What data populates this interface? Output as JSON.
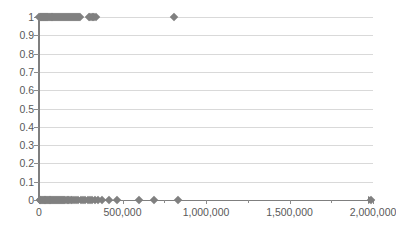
{
  "chart_data": {
    "type": "scatter",
    "title": "",
    "xlabel": "",
    "ylabel": "",
    "xlim": [
      0,
      2000000
    ],
    "ylim": [
      0,
      1
    ],
    "grid": true,
    "legend": false,
    "marker": {
      "shape": "diamond",
      "color": "#808080",
      "size": 6
    },
    "axis_color": "#7f7f7f",
    "gridline_color": "#d9d9d9",
    "label_color": "#595959",
    "y_ticks": [
      {
        "value": 1,
        "label": "1"
      },
      {
        "value": 0.9,
        "label": "0.9"
      },
      {
        "value": 0.8,
        "label": "0.8"
      },
      {
        "value": 0.7,
        "label": "0.7"
      },
      {
        "value": 0.6,
        "label": "0.6"
      },
      {
        "value": 0.5,
        "label": "0.5"
      },
      {
        "value": 0.4,
        "label": "0.4"
      },
      {
        "value": 0.3,
        "label": "0.3"
      },
      {
        "value": 0.2,
        "label": "0.2"
      },
      {
        "value": 0.1,
        "label": "0.1"
      },
      {
        "value": 0,
        "label": "0"
      }
    ],
    "x_ticks": [
      {
        "value": 0,
        "label": "0",
        "minor": false
      },
      {
        "value": 250000,
        "label": "",
        "minor": true
      },
      {
        "value": 500000,
        "label": "500,000",
        "minor": false
      },
      {
        "value": 750000,
        "label": "",
        "minor": true
      },
      {
        "value": 1000000,
        "label": "1,000,000",
        "minor": false
      },
      {
        "value": 1250000,
        "label": "",
        "minor": true
      },
      {
        "value": 1500000,
        "label": "1,500,000",
        "minor": false
      },
      {
        "value": 1750000,
        "label": "",
        "minor": true
      },
      {
        "value": 2000000,
        "label": "2,000,000",
        "minor": false
      }
    ],
    "points": [
      {
        "x": 2000,
        "y": 1
      },
      {
        "x": 6000,
        "y": 1
      },
      {
        "x": 10000,
        "y": 1
      },
      {
        "x": 14000,
        "y": 1
      },
      {
        "x": 18000,
        "y": 1
      },
      {
        "x": 22000,
        "y": 1
      },
      {
        "x": 26000,
        "y": 1
      },
      {
        "x": 30000,
        "y": 1
      },
      {
        "x": 34000,
        "y": 1
      },
      {
        "x": 38000,
        "y": 1
      },
      {
        "x": 42000,
        "y": 1
      },
      {
        "x": 46000,
        "y": 1
      },
      {
        "x": 50000,
        "y": 1
      },
      {
        "x": 55000,
        "y": 1
      },
      {
        "x": 60000,
        "y": 1
      },
      {
        "x": 65000,
        "y": 1
      },
      {
        "x": 70000,
        "y": 1
      },
      {
        "x": 75000,
        "y": 1
      },
      {
        "x": 80000,
        "y": 1
      },
      {
        "x": 85000,
        "y": 1
      },
      {
        "x": 90000,
        "y": 1
      },
      {
        "x": 95000,
        "y": 1
      },
      {
        "x": 100000,
        "y": 1
      },
      {
        "x": 106000,
        "y": 1
      },
      {
        "x": 112000,
        "y": 1
      },
      {
        "x": 118000,
        "y": 1
      },
      {
        "x": 124000,
        "y": 1
      },
      {
        "x": 130000,
        "y": 1
      },
      {
        "x": 136000,
        "y": 1
      },
      {
        "x": 142000,
        "y": 1
      },
      {
        "x": 148000,
        "y": 1
      },
      {
        "x": 154000,
        "y": 1
      },
      {
        "x": 160000,
        "y": 1
      },
      {
        "x": 166000,
        "y": 1
      },
      {
        "x": 172000,
        "y": 1
      },
      {
        "x": 178000,
        "y": 1
      },
      {
        "x": 184000,
        "y": 1
      },
      {
        "x": 190000,
        "y": 1
      },
      {
        "x": 196000,
        "y": 1
      },
      {
        "x": 202000,
        "y": 1
      },
      {
        "x": 208000,
        "y": 1
      },
      {
        "x": 214000,
        "y": 1
      },
      {
        "x": 220000,
        "y": 1
      },
      {
        "x": 226000,
        "y": 1
      },
      {
        "x": 232000,
        "y": 1
      },
      {
        "x": 238000,
        "y": 1
      },
      {
        "x": 244000,
        "y": 1
      },
      {
        "x": 300000,
        "y": 1
      },
      {
        "x": 308000,
        "y": 1
      },
      {
        "x": 316000,
        "y": 1
      },
      {
        "x": 324000,
        "y": 1
      },
      {
        "x": 332000,
        "y": 1
      },
      {
        "x": 340000,
        "y": 1
      },
      {
        "x": 810000,
        "y": 1
      },
      {
        "x": 3000,
        "y": 0
      },
      {
        "x": 8000,
        "y": 0
      },
      {
        "x": 13000,
        "y": 0
      },
      {
        "x": 18000,
        "y": 0
      },
      {
        "x": 23000,
        "y": 0
      },
      {
        "x": 28000,
        "y": 0
      },
      {
        "x": 33000,
        "y": 0
      },
      {
        "x": 38000,
        "y": 0
      },
      {
        "x": 43000,
        "y": 0
      },
      {
        "x": 48000,
        "y": 0
      },
      {
        "x": 53000,
        "y": 0
      },
      {
        "x": 58000,
        "y": 0
      },
      {
        "x": 63000,
        "y": 0
      },
      {
        "x": 68000,
        "y": 0
      },
      {
        "x": 73000,
        "y": 0
      },
      {
        "x": 78000,
        "y": 0
      },
      {
        "x": 84000,
        "y": 0
      },
      {
        "x": 90000,
        "y": 0
      },
      {
        "x": 96000,
        "y": 0
      },
      {
        "x": 102000,
        "y": 0
      },
      {
        "x": 108000,
        "y": 0
      },
      {
        "x": 114000,
        "y": 0
      },
      {
        "x": 120000,
        "y": 0
      },
      {
        "x": 126000,
        "y": 0
      },
      {
        "x": 132000,
        "y": 0
      },
      {
        "x": 138000,
        "y": 0
      },
      {
        "x": 144000,
        "y": 0
      },
      {
        "x": 150000,
        "y": 0
      },
      {
        "x": 158000,
        "y": 0
      },
      {
        "x": 166000,
        "y": 0
      },
      {
        "x": 174000,
        "y": 0
      },
      {
        "x": 182000,
        "y": 0
      },
      {
        "x": 190000,
        "y": 0
      },
      {
        "x": 200000,
        "y": 0
      },
      {
        "x": 212000,
        "y": 0
      },
      {
        "x": 224000,
        "y": 0
      },
      {
        "x": 236000,
        "y": 0
      },
      {
        "x": 250000,
        "y": 0
      },
      {
        "x": 264000,
        "y": 0
      },
      {
        "x": 278000,
        "y": 0
      },
      {
        "x": 292000,
        "y": 0
      },
      {
        "x": 306000,
        "y": 0
      },
      {
        "x": 320000,
        "y": 0
      },
      {
        "x": 336000,
        "y": 0
      },
      {
        "x": 352000,
        "y": 0
      },
      {
        "x": 380000,
        "y": 0
      },
      {
        "x": 420000,
        "y": 0
      },
      {
        "x": 470000,
        "y": 0
      },
      {
        "x": 600000,
        "y": 0
      },
      {
        "x": 690000,
        "y": 0
      },
      {
        "x": 830000,
        "y": 0
      },
      {
        "x": 1990000,
        "y": 0
      }
    ]
  }
}
